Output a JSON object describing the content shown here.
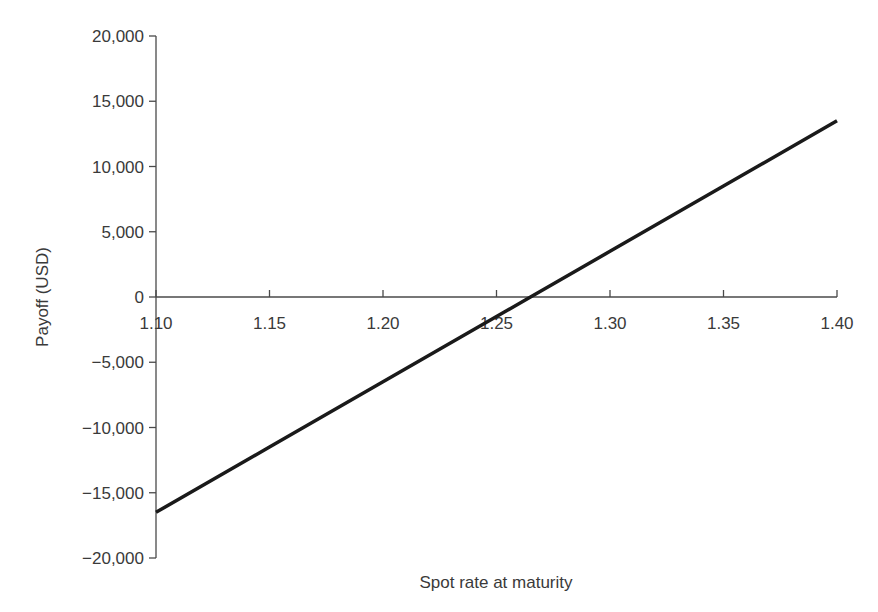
{
  "chart_data": {
    "type": "line",
    "title": "",
    "xlabel": "Spot rate at maturity",
    "ylabel": "Payoff (USD)",
    "xlim": [
      1.1,
      1.4
    ],
    "ylim": [
      -20000,
      20000
    ],
    "grid": false,
    "legend": null,
    "x_ticks": [
      1.1,
      1.15,
      1.2,
      1.25,
      1.3,
      1.35,
      1.4
    ],
    "x_tick_labels": [
      "1.10",
      "1.15",
      "1.20",
      "1.25",
      "1.30",
      "1.35",
      "1.40"
    ],
    "y_ticks": [
      20000,
      15000,
      10000,
      5000,
      0,
      -5000,
      -10000,
      -15000,
      -20000
    ],
    "y_tick_labels": [
      "20,000",
      "15,000",
      "10,000",
      "5,000",
      "0",
      "−5,000",
      "−10,000",
      "−15,000",
      "−20,000"
    ],
    "x_axis_position": "y=0",
    "series": [
      {
        "name": "Payoff",
        "color": "#1a1a1a",
        "x": [
          1.1,
          1.15,
          1.2,
          1.25,
          1.265,
          1.3,
          1.35,
          1.4
        ],
        "y": [
          -16500,
          -11500,
          -6500,
          -1500,
          0,
          3500,
          8500,
          13500
        ]
      }
    ]
  }
}
